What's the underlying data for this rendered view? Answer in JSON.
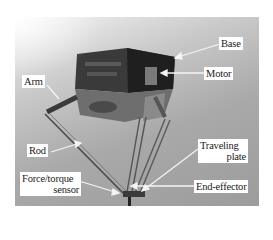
{
  "figure": {
    "colors": {
      "background": "#ffffff",
      "photo_tone": "#a9a9a9",
      "label_bg": "#ffffff",
      "label_text": "#1a1a1a",
      "arrow": "#f4f4f4"
    },
    "labels": {
      "base": "Base",
      "motor": "Motor",
      "arm": "Arm",
      "rod": "Rod",
      "traveling_plate_line1": "Traveling",
      "traveling_plate_line2": "plate",
      "sensor_line1": "Force/torque",
      "sensor_line2": "sensor",
      "end_effector": "End-effector"
    }
  }
}
